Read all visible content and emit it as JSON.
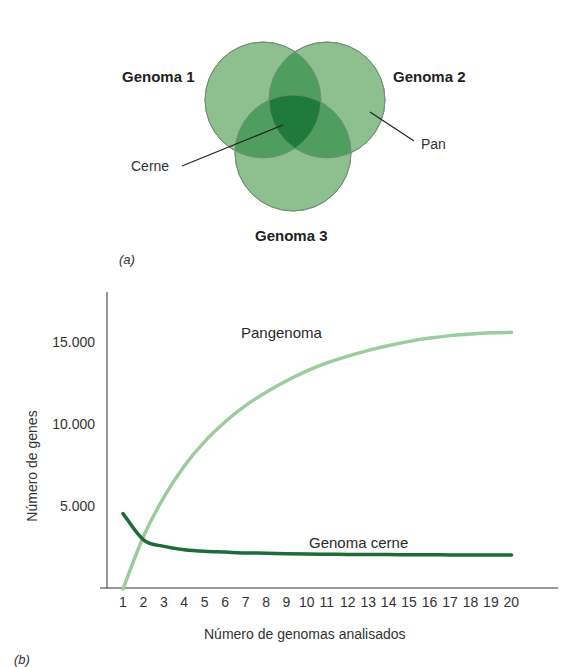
{
  "panel_a": {
    "tag": "(a)",
    "circles": [
      {
        "label": "Genoma 1"
      },
      {
        "label": "Genoma 2"
      },
      {
        "label": "Genoma 3"
      }
    ],
    "annotations": {
      "core": "Cerne",
      "pan": "Pan"
    },
    "colors": {
      "single": "#8dbf8f",
      "double": "#4f9e5f",
      "triple": "#1f7a3c",
      "outline": "#6f8f74"
    }
  },
  "panel_b": {
    "tag": "(b)"
  },
  "chart_data": {
    "type": "line",
    "title": "",
    "xlabel": "Número de genomas analisados",
    "ylabel": "Número de genes",
    "x": [
      1,
      2,
      3,
      4,
      5,
      6,
      7,
      8,
      9,
      10,
      11,
      12,
      13,
      14,
      15,
      16,
      17,
      18,
      19,
      20
    ],
    "x_tick_labels": [
      "1",
      "2",
      "3",
      "4",
      "5",
      "6",
      "7",
      "8",
      "9",
      "10",
      "11",
      "12",
      "13",
      "14",
      "15",
      "16",
      "17",
      "18",
      "19",
      "20"
    ],
    "y_tick_labels": [
      "5.000",
      "10.000",
      "15.000"
    ],
    "y_ticks": [
      5000,
      10000,
      15000
    ],
    "ylim": [
      0,
      17000
    ],
    "grid": false,
    "legend": "inline labels",
    "series": [
      {
        "name": "Pangenoma",
        "color": "#9ccc9e",
        "values": [
          0,
          3200,
          5600,
          7500,
          9000,
          10200,
          11200,
          12000,
          12700,
          13300,
          13800,
          14200,
          14550,
          14850,
          15100,
          15300,
          15450,
          15550,
          15620,
          15650
        ]
      },
      {
        "name": "Genoma cerne",
        "color": "#1e6b3a",
        "values": [
          4600,
          3000,
          2600,
          2400,
          2300,
          2250,
          2200,
          2180,
          2150,
          2130,
          2120,
          2110,
          2100,
          2100,
          2090,
          2090,
          2080,
          2080,
          2080,
          2080
        ]
      }
    ]
  }
}
